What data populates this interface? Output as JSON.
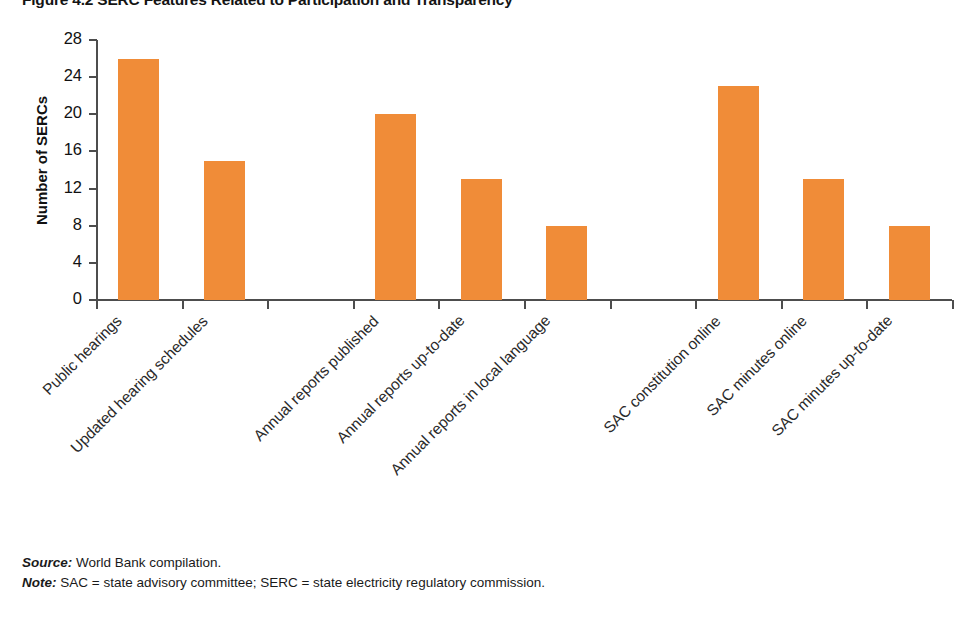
{
  "figure": {
    "title": "Figure 4.2 SERC Features Related to Participation and Transparency",
    "source_label": "Source:",
    "source_text": " World Bank compilation.",
    "note_label": "Note:",
    "note_text": " SAC = state advisory committee; SERC = state electricity regulatory commission."
  },
  "chart_data": {
    "type": "bar",
    "title": "Figure 4.2 SERC Features Related to Participation and Transparency",
    "xlabel": "",
    "ylabel": "Number of SERCs",
    "ylim": [
      0,
      28
    ],
    "yticks": [
      0,
      4,
      8,
      12,
      16,
      20,
      24,
      28
    ],
    "ytick_labels": [
      "0",
      "4",
      "8",
      "12",
      "16",
      "20",
      "24",
      "28"
    ],
    "grid": false,
    "legend": false,
    "bar_color": "#f08c38",
    "categories": [
      "Public hearings",
      "Updated hearing schedules",
      "Annual reports published",
      "Annual reports up-to-date",
      "Annual reports in local language",
      "SAC constitution online",
      "SAC minutes online",
      "SAC minutes up-to-date"
    ],
    "values": [
      26,
      15,
      20,
      13,
      8,
      23,
      13,
      8
    ],
    "slots": [
      0,
      1,
      3,
      4,
      5,
      7,
      8,
      9
    ],
    "slot_count": 10
  }
}
